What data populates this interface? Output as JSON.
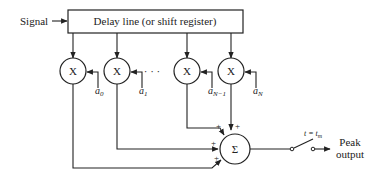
{
  "diagram": {
    "input_label": "Signal",
    "delay_line_label": "Delay line (or shift register)",
    "multiplier_symbol": "X",
    "ellipsis": "· · ·",
    "coefficients": [
      {
        "base": "a",
        "sub": "0"
      },
      {
        "base": "a",
        "sub": "1"
      },
      {
        "base": "a",
        "sub": "N−1"
      },
      {
        "base": "a",
        "sub": "N"
      }
    ],
    "summer_symbol": "Σ",
    "plus_sign": "+",
    "switch_label": "t = t",
    "switch_label_sub": "m",
    "output_label_line1": "Peak",
    "output_label_line2": "output"
  }
}
